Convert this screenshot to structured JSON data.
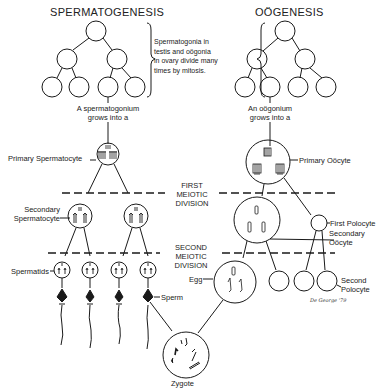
{
  "titles": {
    "left": "SPERMATOGENESIS",
    "right": "OÖGENESIS"
  },
  "mitosis_note": [
    "Spermatogonia in",
    "testis and oögonia",
    "in ovary divide many",
    "times by mitosis."
  ],
  "left_labels": {
    "grows": [
      "A spermatogonium",
      "grows into a"
    ],
    "primary": "Primary Spermatocyte",
    "secondary": [
      "Secondary",
      "Spermatocyte"
    ],
    "spermatids": "Spermatids",
    "sperm": "Sperm"
  },
  "right_labels": {
    "grows": [
      "An oögonium",
      "grows into a"
    ],
    "primary": "Primary Oöcyte",
    "first_polocyte": "First Polocyte",
    "secondary": [
      "Secondary",
      "Oöcyte"
    ],
    "egg": "Egg",
    "second_polocyte": [
      "Second",
      "Polocyte"
    ]
  },
  "divisions": {
    "first": [
      "FIRST",
      "MEIOTIC",
      "DIVISION"
    ],
    "second": [
      "SECOND",
      "MEIOTIC",
      "DIVISION"
    ]
  },
  "zygote": "Zygote",
  "signature": "De George '79",
  "colors": {
    "ink": "#1a1a1a",
    "paper": "#ffffff"
  }
}
